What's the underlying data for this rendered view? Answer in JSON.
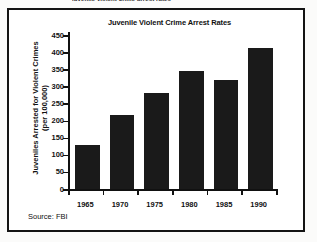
{
  "page": {
    "top_cut_text": "juvenile violent crime arrest rates",
    "source_note": "Source: FBI"
  },
  "chart_data": {
    "type": "bar",
    "title": "Juvenile Violent Crime Arrest Rates",
    "xlabel": "",
    "ylabel": "Juveniles Arrested for Violent Crimes\n(per 100,000)",
    "categories": [
      "1965",
      "1970",
      "1975",
      "1980",
      "1985",
      "1990"
    ],
    "values": [
      128,
      216,
      280,
      345,
      318,
      412
    ],
    "ylim": [
      0,
      450
    ],
    "yticks": [
      0,
      50,
      100,
      150,
      200,
      250,
      300,
      350,
      400,
      450
    ],
    "ytick_labels": [
      "0",
      "50",
      "100",
      "150",
      "200",
      "250",
      "300",
      "350",
      "400",
      "450"
    ],
    "grid": false,
    "legend": false,
    "bar_color": "#1a1a1a",
    "source": "Source: FBI"
  }
}
